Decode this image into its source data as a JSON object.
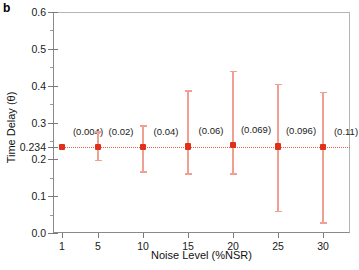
{
  "panel": {
    "label": "b"
  },
  "chart_data": {
    "type": "scatter",
    "title": "",
    "xlabel": "Noise Level (%NSR)",
    "ylabel": "Time Delay (θ)",
    "categories": [
      "1",
      "5",
      "10",
      "15",
      "20",
      "25",
      "30"
    ],
    "x": [
      1,
      5,
      10,
      15,
      20,
      25,
      30
    ],
    "values": [
      0.234,
      0.234,
      0.234,
      0.235,
      0.239,
      0.235,
      0.234
    ],
    "err_low": [
      0.234,
      0.198,
      0.167,
      0.162,
      0.162,
      0.061,
      0.029
    ],
    "err_high": [
      0.234,
      0.276,
      0.292,
      0.387,
      0.44,
      0.405,
      0.383
    ],
    "point_labels": [
      "(0.004)",
      "(0.02)",
      "(0.04)",
      "(0.06)",
      "(0.069)",
      "(0.096)",
      "(0.11)"
    ],
    "reference_line": 0.234,
    "reference_line_label": "0.234",
    "ylim": [
      0.0,
      0.6
    ],
    "xlim": [
      0,
      33
    ],
    "ytick_values": [
      0.0,
      0.1,
      0.2,
      0.234,
      0.3,
      0.4,
      0.5,
      0.6
    ],
    "ytick_labels": [
      "0.0",
      "0.1",
      "0.2",
      "0.234",
      "0.3",
      "0.4",
      "0.5",
      "0.6"
    ],
    "yminor_values": [
      0.05,
      0.15,
      0.25,
      0.35,
      0.45,
      0.55
    ],
    "grid": false,
    "legend": null,
    "marker_color": "#e03018",
    "errorbar_color": "#f0a092",
    "reference_color": "#e8644a",
    "axis_color": "#8a8a8a"
  }
}
